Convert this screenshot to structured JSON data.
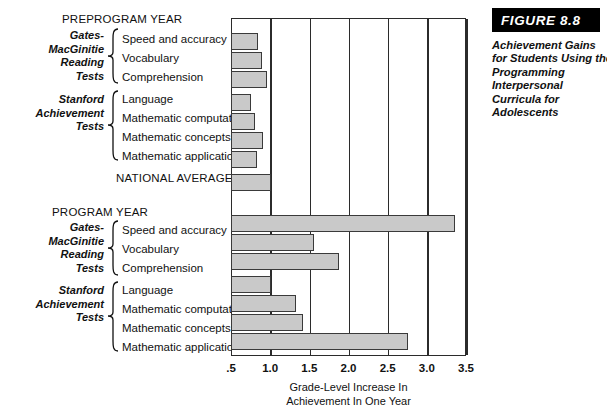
{
  "figure": {
    "band_label": "FIGURE 8.8",
    "caption_lines": [
      "Achievement Gains",
      "for Students Using the",
      "Programming",
      "Interpersonal",
      "Curricula for",
      "Adolescents"
    ]
  },
  "sections": {
    "preprogram_heading": "PREPROGRAM YEAR",
    "program_heading": "PROGRAM YEAR",
    "national_average_label": "NATIONAL AVERAGE"
  },
  "groups": {
    "gates_lines": [
      "Gates-",
      "MacGinitie",
      "Reading",
      "Tests"
    ],
    "stanford_lines": [
      "Stanford",
      "Achievement",
      "Tests"
    ]
  },
  "chart_data": {
    "type": "bar",
    "orientation": "horizontal",
    "title": "Achievement Gains for Students Using the Programming Interpersonal Curricula for Adolescents",
    "xlabel": "Grade-Level Increase In Achievement In One Year",
    "ylabel": "",
    "xlim": [
      0.5,
      3.5
    ],
    "xticks": [
      0.5,
      1.0,
      1.5,
      2.0,
      2.5,
      3.0,
      3.5
    ],
    "xticklabels": [
      ".5",
      "1.0",
      "1.5",
      "2.0",
      "2.5",
      "3.0",
      "3.5"
    ],
    "grid": true,
    "legend": "none",
    "bar_color": "#c9c9c9",
    "bar_edge_color": "#3a3a3a",
    "categories": [
      "Speed and accuracy",
      "Vocabulary",
      "Comprehension",
      "Language",
      "Mathematic computation",
      "Mathematic concepts",
      "Mathematic applications",
      "NATIONAL AVERAGE",
      "Speed and accuracy",
      "Vocabulary",
      "Comprehension",
      "Language",
      "Mathematic computation",
      "Mathematic concepts",
      "Mathematic applications"
    ],
    "series": [
      {
        "name": "Preprogram Year",
        "group": "Gates-MacGinitie Reading Tests",
        "items": [
          {
            "label": "Speed and accuracy",
            "value": 0.83
          },
          {
            "label": "Vocabulary",
            "value": 0.88
          },
          {
            "label": "Comprehension",
            "value": 0.95
          }
        ]
      },
      {
        "name": "Preprogram Year",
        "group": "Stanford Achievement Tests",
        "items": [
          {
            "label": "Language",
            "value": 0.74
          },
          {
            "label": "Mathematic computation",
            "value": 0.79
          },
          {
            "label": "Mathematic concepts",
            "value": 0.89
          },
          {
            "label": "Mathematic applications",
            "value": 0.82
          }
        ]
      },
      {
        "name": "National Average",
        "group": "",
        "items": [
          {
            "label": "NATIONAL AVERAGE",
            "value": 1.0
          }
        ]
      },
      {
        "name": "Program Year",
        "group": "Gates-MacGinitie Reading Tests",
        "items": [
          {
            "label": "Speed and accuracy",
            "value": 3.35
          },
          {
            "label": "Vocabulary",
            "value": 1.55
          },
          {
            "label": "Comprehension",
            "value": 1.87
          }
        ]
      },
      {
        "name": "Program Year",
        "group": "Stanford Achievement Tests",
        "items": [
          {
            "label": "Language",
            "value": 1.0
          },
          {
            "label": "Mathematic computation",
            "value": 1.32
          },
          {
            "label": "Mathematic concepts",
            "value": 1.4
          },
          {
            "label": "Mathematic applications",
            "value": 2.75
          }
        ]
      }
    ],
    "axis_title_lines": [
      "Grade-Level Increase In",
      "Achievement In One Year"
    ]
  }
}
